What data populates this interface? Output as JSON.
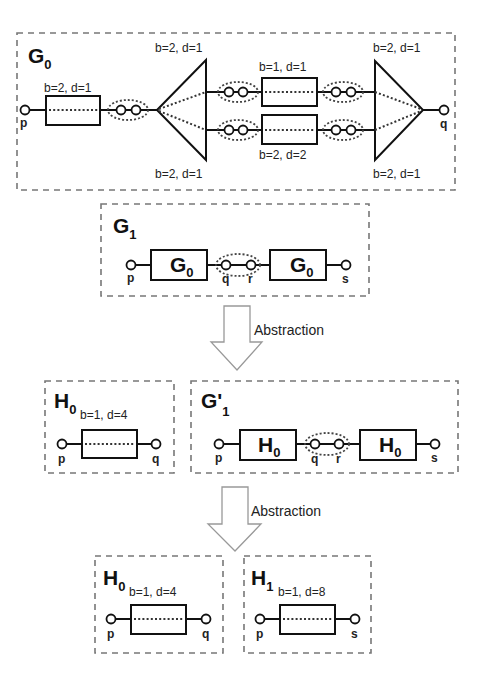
{
  "g0": {
    "title": "G",
    "title_sub": "0",
    "port_left": "p",
    "port_right": "q",
    "first_block_label": "b=2, d=1",
    "left_split_top_label": "b=2, d=1",
    "left_split_bottom_label": "b=2, d=1",
    "mid_top_label": "b=1, d=1",
    "mid_bottom_label": "b=2, d=2",
    "right_join_top_label": "b=2, d=1",
    "right_join_bottom_label": "b=2, d=1"
  },
  "g1": {
    "title": "G",
    "title_sub": "1",
    "block_left": "G",
    "block_left_sub": "0",
    "block_right": "G",
    "block_right_sub": "0",
    "ports": [
      "p",
      "q",
      "r",
      "s"
    ]
  },
  "arrow1": {
    "label": "Abstraction"
  },
  "h0": {
    "title": "H",
    "title_sub": "0",
    "params": "b=1, d=4",
    "ports": [
      "p",
      "q"
    ]
  },
  "g1prime": {
    "title": "G'",
    "title_sub": "1",
    "block_left": "H",
    "block_left_sub": "0",
    "block_right": "H",
    "block_right_sub": "0",
    "ports": [
      "p",
      "q",
      "r",
      "s"
    ]
  },
  "arrow2": {
    "label": "Abstraction"
  },
  "h0_final": {
    "title": "H",
    "title_sub": "0",
    "params": "b=1, d=4",
    "ports": [
      "p",
      "q"
    ]
  },
  "h1": {
    "title": "H",
    "title_sub": "1",
    "params": "b=1, d=8",
    "ports": [
      "p",
      "s"
    ]
  }
}
